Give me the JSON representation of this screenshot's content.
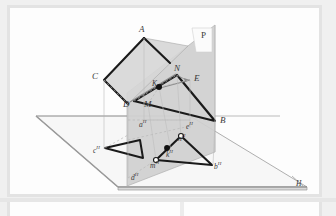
{
  "figure": {
    "type": "descriptive-geometry-projection-diagram",
    "title": "",
    "planes": {
      "vertical": {
        "label": "P",
        "fill": "#d2d2d2",
        "stroke": "#b4b4b4"
      },
      "horizontal": {
        "label": "H",
        "fill": "#f4f4f4",
        "stroke": "#9a9a9a"
      },
      "oblique": {
        "label": "",
        "fill": "#d8d8d8",
        "stroke": "#9a9a9a"
      }
    },
    "labels": {
      "A": "A",
      "B": "B",
      "C": "C",
      "D": "D",
      "E": "E",
      "M": "M",
      "N": "N",
      "K": "K",
      "P": "P",
      "H": "H",
      "aH": "a",
      "bH": "b",
      "cH": "c",
      "dH": "d",
      "eH": "e",
      "kH": "k",
      "mH": "m",
      "nH": "n",
      "sup_H": "H"
    },
    "points": [
      {
        "name": "A",
        "label": "A",
        "x": 140,
        "y": 33,
        "kind": "vertex-upper"
      },
      {
        "name": "B",
        "label": "B",
        "x": 218,
        "y": 121,
        "kind": "vertex-upper"
      },
      {
        "name": "C",
        "label": "C",
        "x": 99,
        "y": 77,
        "kind": "vertex-upper"
      },
      {
        "name": "D",
        "label": "D",
        "x": 126,
        "y": 105,
        "kind": "vertex-upper"
      },
      {
        "name": "E",
        "label": "E",
        "x": 192,
        "y": 79,
        "kind": "vertex-upper"
      },
      {
        "name": "N",
        "label": "N",
        "x": 172,
        "y": 71,
        "kind": "vertex-upper"
      },
      {
        "name": "M",
        "label": "M",
        "x": 148,
        "y": 105,
        "kind": "vertex-upper"
      },
      {
        "name": "K",
        "label": "K",
        "x": 159,
        "y": 86,
        "kind": "intersection-filled"
      },
      {
        "name": "aH",
        "label": "a",
        "x": 143,
        "y": 121,
        "kind": "projection"
      },
      {
        "name": "bH",
        "label": "b",
        "x": 214,
        "y": 165,
        "kind": "projection"
      },
      {
        "name": "cH",
        "label": "c",
        "x": 99,
        "y": 150,
        "kind": "projection"
      },
      {
        "name": "dH",
        "label": "d",
        "x": 137,
        "y": 178,
        "kind": "projection"
      },
      {
        "name": "eH",
        "label": "e",
        "x": 189,
        "y": 127,
        "kind": "projection"
      },
      {
        "name": "kH",
        "label": "k",
        "x": 171,
        "y": 150,
        "kind": "projection-filled"
      },
      {
        "name": "mH",
        "label": "m",
        "x": 155,
        "y": 161,
        "kind": "projection-open"
      },
      {
        "name": "nH",
        "label": "n",
        "x": 180,
        "y": 137,
        "kind": "projection-open"
      }
    ],
    "note": "Two triangles ABC and DEF-type figures with plane P (vertical) and plane H (horizontal), showing orthographic projections labelled with superscript H."
  }
}
